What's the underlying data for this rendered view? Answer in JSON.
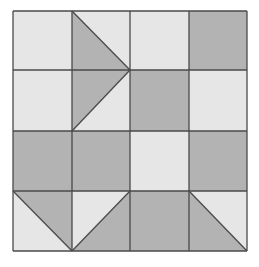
{
  "diagram": {
    "type": "quilt-block-grid",
    "rows": 4,
    "cols": 4,
    "colors": {
      "light": "#e6e6e6",
      "dark": "#b3b3b3",
      "line": "#4a4a4a",
      "background": "#ffffff"
    },
    "grid_x": [
      13,
      72,
      130,
      189,
      247
    ],
    "grid_y": [
      11,
      70,
      131,
      191,
      251
    ],
    "cells": [
      [
        {
          "fill": "light"
        },
        {
          "fill": "light",
          "triangle": {
            "points": "72,11 130,70 72,70",
            "fill": "dark"
          }
        },
        {
          "fill": "light"
        },
        {
          "fill": "dark"
        }
      ],
      [
        {
          "fill": "light"
        },
        {
          "fill": "light",
          "triangle": {
            "points": "72,70 130,70 72,131",
            "fill": "dark"
          }
        },
        {
          "fill": "dark"
        },
        {
          "fill": "light"
        }
      ],
      [
        {
          "fill": "dark"
        },
        {
          "fill": "dark"
        },
        {
          "fill": "light"
        },
        {
          "fill": "dark"
        }
      ],
      [
        {
          "fill": "light",
          "triangle": {
            "points": "13,191 72,191 72,251",
            "fill": "dark"
          }
        },
        {
          "fill": "light",
          "triangle": {
            "points": "130,191 130,251 72,251",
            "fill": "dark"
          }
        },
        {
          "fill": "dark"
        },
        {
          "fill": "light",
          "triangle": {
            "points": "189,191 247,251 189,251",
            "fill": "dark"
          }
        }
      ]
    ],
    "diagonals": [
      "72,11 130,70",
      "130,70 72,131",
      "13,191 72,251",
      "72,251 130,191",
      "189,191 247,251"
    ]
  }
}
